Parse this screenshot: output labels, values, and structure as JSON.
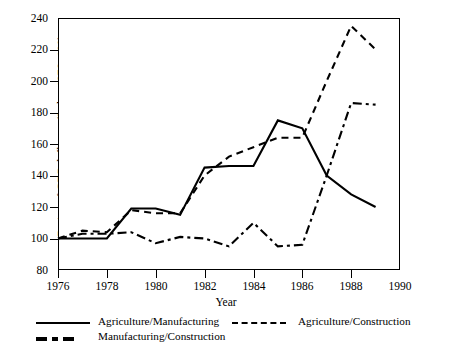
{
  "chart_data": {
    "type": "line",
    "title": "",
    "xlabel": "Year",
    "ylabel": "Ratios of GDP deflators (Index 1976=100)",
    "xlim": [
      1976,
      1990
    ],
    "ylim": [
      80,
      240
    ],
    "xticks": [
      1976,
      1978,
      1980,
      1982,
      1984,
      1986,
      1988,
      1990
    ],
    "yticks": [
      80,
      100,
      120,
      140,
      160,
      180,
      200,
      220,
      240
    ],
    "xtick_labels": [
      "1976",
      "1978",
      "1980",
      "1982",
      "1984",
      "1986",
      "1988",
      "1990"
    ],
    "ytick_labels": [
      "80",
      "100",
      "120",
      "140",
      "160",
      "180",
      "200",
      "220",
      "240"
    ],
    "grid": false,
    "legend_position": "below",
    "x": [
      1976,
      1977,
      1978,
      1979,
      1980,
      1981,
      1982,
      1983,
      1984,
      1985,
      1986,
      1987,
      1988,
      1989
    ],
    "series": [
      {
        "name": "Agriculture/Manufacturing",
        "style": "solid",
        "color": "#000000",
        "values": [
          100,
          100,
          100,
          119,
          119,
          115,
          145,
          146,
          146,
          175,
          170,
          140,
          128,
          120
        ]
      },
      {
        "name": "Agriculture/Construction",
        "style": "dashed",
        "color": "#000000",
        "values": [
          100,
          105,
          104,
          118,
          116,
          116,
          140,
          152,
          158,
          164,
          164,
          200,
          235,
          220
        ]
      },
      {
        "name": "Manufacturing/Construction",
        "style": "dash-dot",
        "color": "#000000",
        "values": [
          100,
          103,
          103,
          104,
          97,
          101,
          100,
          95,
          110,
          95,
          96,
          140,
          186,
          185
        ]
      }
    ]
  },
  "legend": {
    "items": [
      {
        "label": "Agriculture/Manufacturing",
        "key": "solid-line-key"
      },
      {
        "label": "Agriculture/Construction",
        "key": "dashed-line-key"
      },
      {
        "label": "Manufacturing/Construction",
        "key": "dash-dot-line-key"
      }
    ]
  }
}
